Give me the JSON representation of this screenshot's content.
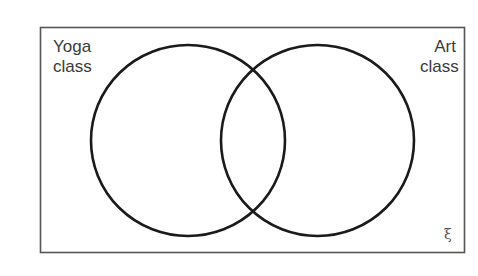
{
  "diagram": {
    "type": "venn",
    "sets": [
      {
        "name": "Yoga class",
        "label_lines": [
          "Yoga",
          "class"
        ]
      },
      {
        "name": "Art class",
        "label_lines": [
          "Art",
          "class"
        ]
      }
    ],
    "universal_set_symbol": "ξ",
    "colors": {
      "circle_stroke": "#1a1a1a",
      "box_stroke": "#555555",
      "text": "#3a3a3a"
    }
  }
}
